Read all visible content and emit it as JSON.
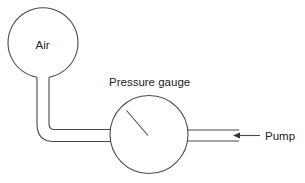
{
  "diagram": {
    "type": "schematic",
    "colors": {
      "line": "#4a4a4a",
      "text": "#222222",
      "background": "#ffffff"
    },
    "labels": {
      "air": "Air",
      "gauge": "Pressure gauge",
      "pump": "Pump"
    },
    "components": [
      {
        "id": "air-reservoir",
        "shape": "circle",
        "label": "Air"
      },
      {
        "id": "connecting-pipe",
        "shape": "bent-pipe"
      },
      {
        "id": "pressure-gauge",
        "shape": "circle-with-needle",
        "label": "Pressure gauge"
      },
      {
        "id": "pump-inlet-pipe",
        "shape": "straight-pipe"
      },
      {
        "id": "flow-arrow",
        "shape": "arrow",
        "direction": "left",
        "label": "Pump"
      }
    ]
  }
}
